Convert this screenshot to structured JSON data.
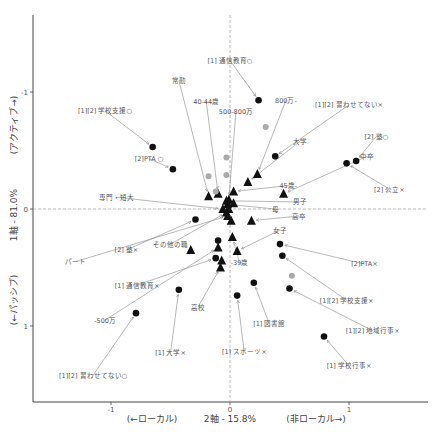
{
  "chart_data": {
    "type": "scatter",
    "title": "",
    "xlabel": "2軸 - 15.8%",
    "xlabel_left": "(←ローカル)",
    "xlabel_right": "(非ローカル→)",
    "ylabel": "1軸 - 81.0%",
    "ylabel_top": "(アクティブ→)",
    "ylabel_bottom": "(←パッシブ)",
    "xlim": [
      -1.65,
      1.5
    ],
    "ylim": [
      -1.55,
      1.65
    ],
    "y_inverted": true,
    "x_ticks": [
      -1,
      0,
      1
    ],
    "y_ticks": [
      -1,
      0,
      1
    ],
    "x_tick_labels": [
      "-1",
      "0",
      "1"
    ],
    "y_tick_labels": [
      "-1",
      "0",
      "1"
    ],
    "reference_lines": {
      "x": 0,
      "y": 0,
      "style": "dashed"
    },
    "series": [
      {
        "name": "activity-categories",
        "marker": "circle-black",
        "points": [
          {
            "label": "[1] 通信教育○",
            "x": 0.24,
            "y": -0.93,
            "lx": 0.0,
            "ly": -1.27
          },
          {
            "label": "[1][2] 学校支援○",
            "x": -0.65,
            "y": -0.53,
            "lx": -1.05,
            "ly": -0.84
          },
          {
            "label": "[2]PTA ○",
            "x": -0.48,
            "y": -0.34,
            "lx": -0.68,
            "ly": -0.43
          },
          {
            "label": "[1][2] 習わせてない×",
            "x": 0.38,
            "y": -0.45,
            "lx": 1.0,
            "ly": -0.89
          },
          {
            "label": "[2] 塾○",
            "x": 1.06,
            "y": -0.41,
            "lx": 1.23,
            "ly": -0.62
          },
          {
            "label": "[2] 公立×",
            "x": 0.98,
            "y": -0.39,
            "lx": 1.34,
            "ly": -0.17
          },
          {
            "label": "[2] 塾×",
            "x": -0.29,
            "y": 0.09,
            "lx": -0.87,
            "ly": 0.35
          },
          {
            "label": "[1] 通信教育×",
            "x": -0.12,
            "y": 0.42,
            "lx": -0.78,
            "ly": 0.65
          },
          {
            "label": "[1] 大学×",
            "x": -0.43,
            "y": 0.69,
            "lx": -0.5,
            "ly": 1.23
          },
          {
            "label": "[1][2] 習わせてない○",
            "x": -0.79,
            "y": 0.89,
            "lx": -1.15,
            "ly": 1.42
          },
          {
            "label": "[1] スポーツ×",
            "x": 0.06,
            "y": 0.74,
            "lx": 0.12,
            "ly": 1.22
          },
          {
            "label": "[1] 図書館",
            "x": 0.2,
            "y": 0.63,
            "lx": 0.33,
            "ly": 0.98
          },
          {
            "label": "[1][2] 学校支援×",
            "x": 0.44,
            "y": 0.4,
            "lx": 0.98,
            "ly": 0.78
          },
          {
            "label": "[1][2] 地域行事×",
            "x": 0.5,
            "y": 0.68,
            "lx": 1.2,
            "ly": 1.04
          },
          {
            "label": "[1] 学校行事×",
            "x": 0.79,
            "y": 1.09,
            "lx": 1.0,
            "ly": 1.34
          },
          {
            "label": "[2]PTA×",
            "x": 0.42,
            "y": 0.3,
            "lx": 1.13,
            "ly": 0.47
          },
          {
            "label": "",
            "x": -0.1,
            "y": 0.27,
            "lx": null,
            "ly": null
          }
        ]
      },
      {
        "name": "attribute-categories",
        "marker": "triangle-black",
        "points": [
          {
            "label": "800万-",
            "x": 0.23,
            "y": -0.3,
            "lx": 0.47,
            "ly": -0.93
          },
          {
            "label": "大学",
            "x": 0.15,
            "y": -0.23,
            "lx": 0.59,
            "ly": -0.58
          },
          {
            "label": "45歳-",
            "x": 0.03,
            "y": -0.15,
            "lx": 0.49,
            "ly": -0.2
          },
          {
            "label": "男子",
            "x": -0.03,
            "y": -0.07,
            "lx": 0.59,
            "ly": -0.06
          },
          {
            "label": "母",
            "x": -0.02,
            "y": -0.04,
            "lx": 0.38,
            "ly": 0.0
          },
          {
            "label": "40-44歳",
            "x": -0.1,
            "y": -0.13,
            "lx": -0.2,
            "ly": -0.92
          },
          {
            "label": "500-800万",
            "x": -0.01,
            "y": -0.08,
            "lx": 0.05,
            "ly": -0.83
          },
          {
            "label": "専門・短大",
            "x": -0.06,
            "y": 0.0,
            "lx": -0.95,
            "ly": -0.1
          },
          {
            "label": "常勤",
            "x": -0.18,
            "y": -0.11,
            "lx": -0.43,
            "ly": -1.1
          },
          {
            "label": "中卒",
            "x": 0.45,
            "y": -0.13,
            "lx": 1.15,
            "ly": -0.45
          },
          {
            "label": "高卒",
            "x": 0.18,
            "y": 0.1,
            "lx": 0.58,
            "ly": 0.06
          },
          {
            "label": "女子",
            "x": 0.06,
            "y": 0.36,
            "lx": 0.42,
            "ly": 0.18
          },
          {
            "label": "-39歳",
            "x": 0.02,
            "y": 0.24,
            "lx": 0.08,
            "ly": 0.46
          },
          {
            "label": "父",
            "x": 0.01,
            "y": 0.1,
            "lx": null,
            "ly": null
          },
          {
            "label": "-500万",
            "x": -0.1,
            "y": 0.33,
            "lx": -1.05,
            "ly": 0.95
          },
          {
            "label": "その他の職",
            "x": -0.03,
            "y": 0.03,
            "lx": -0.5,
            "ly": 0.3
          },
          {
            "label": "パート",
            "x": -0.02,
            "y": 0.06,
            "lx": -1.3,
            "ly": 0.45
          },
          {
            "label": "高校",
            "x": -0.08,
            "y": 0.5,
            "lx": -0.27,
            "ly": 0.84
          },
          {
            "label": "",
            "x": -0.07,
            "y": 0.44,
            "lx": null,
            "ly": null
          },
          {
            "label": "",
            "x": -0.33,
            "y": 0.35,
            "lx": null,
            "ly": null
          },
          {
            "label": "",
            "x": -0.01,
            "y": 0.0,
            "lx": null,
            "ly": null
          },
          {
            "label": "",
            "x": 0.03,
            "y": -0.05,
            "lx": null,
            "ly": null
          }
        ]
      },
      {
        "name": "supplementary",
        "marker": "circle-gray",
        "points": [
          {
            "label": "",
            "x": 0.3,
            "y": -0.7
          },
          {
            "label": "",
            "x": -0.03,
            "y": -0.29
          },
          {
            "label": "",
            "x": -0.03,
            "y": -0.44
          },
          {
            "label": "",
            "x": -0.18,
            "y": -0.28
          },
          {
            "label": "",
            "x": -0.12,
            "y": -0.15
          },
          {
            "label": "",
            "x": 0.52,
            "y": 0.57
          }
        ]
      }
    ],
    "grid": false,
    "legend": "none"
  }
}
